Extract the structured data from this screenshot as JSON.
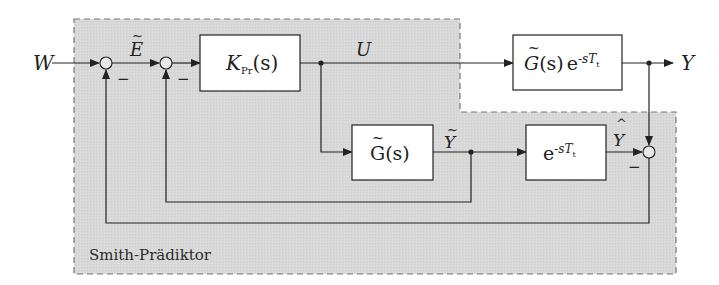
{
  "diagram": {
    "title": "Smith-Prädiktor",
    "region_label": "Smith-Prädiktor",
    "colors": {
      "region_fill": "#d9d9d9",
      "region_border": "#777777",
      "line": "#222222",
      "block_fill": "#ffffff"
    },
    "signals": {
      "input": "W",
      "error": "E",
      "error_accent": "~",
      "control": "U",
      "output": "Y",
      "model_output": "Y",
      "model_output_accent": "~",
      "predicted_output": "Y",
      "predicted_output_accent": "^"
    },
    "blocks": {
      "controller": {
        "main": "K",
        "sub": "Pr",
        "arg": "(s)"
      },
      "plant": {
        "main": "G",
        "accent": "~",
        "arg": "(s)",
        "exp": "e",
        "exp_power": "-sT",
        "exp_sub": "t"
      },
      "model": {
        "main": "G",
        "accent": "~",
        "arg": "(s)"
      },
      "delay": {
        "exp": "e",
        "exp_power": "-sT",
        "exp_sub": "t"
      }
    },
    "sum_signs": {
      "sum1_minus": "−",
      "sum2_minus": "−",
      "sum3_minus": "−"
    }
  }
}
